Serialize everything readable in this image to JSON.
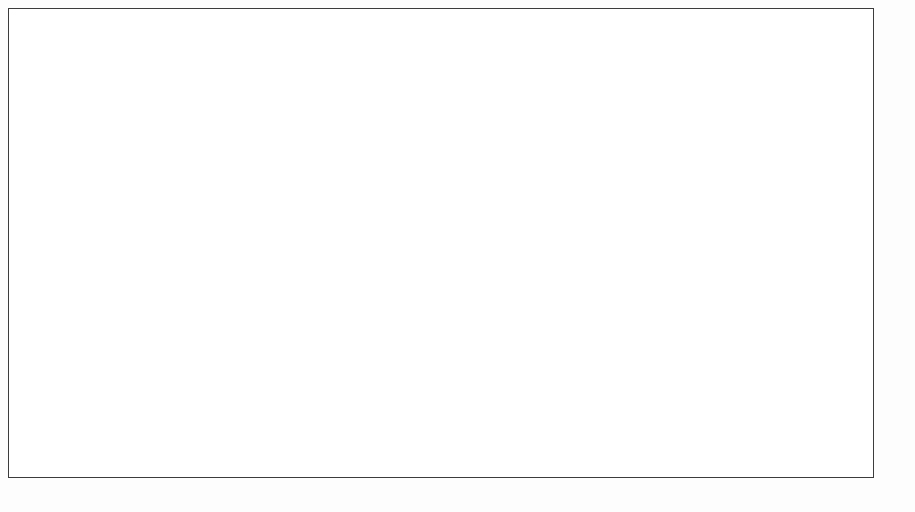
{
  "chart_data": {
    "type": "bar",
    "title": "",
    "subtitle": "",
    "xlabel": "",
    "ylabel": "",
    "orientation": "horizontal",
    "stacked": true,
    "normalized_percent": true,
    "xlim": [
      0,
      100
    ],
    "grid": false,
    "legend_position": "bottom",
    "legend_prefix": "Skala:",
    "series": [
      {
        "name": "Konservative",
        "color": "#6b6b6b"
      },
      {
        "name": "IT-affine Traditionalisten",
        "color": "#2b2b2b"
      },
      {
        "name": "Aufgeschlossene IT-Laien",
        "color": "#e9e9e9"
      },
      {
        "name": "Digitale Vorreiter",
        "color": "#c3c3c3"
      }
    ],
    "groups": [
      {
        "name": "Alter",
        "rows": [
          {
            "label": "Bis 19 Jahre",
            "values": [
              29,
              6,
              42,
              23
            ]
          },
          {
            "label": "20 - 29 Jahre",
            "values": [
              28,
              9,
              32,
              31
            ]
          },
          {
            "label": "30 - 39 Jahre",
            "values": [
              39,
              9,
              26,
              27
            ]
          },
          {
            "label": "40 - 49 Jahre",
            "values": [
              56,
              8,
              16,
              20
            ],
            "value_labels": [
              "56",
              "8",
              "16",
              ""
            ]
          },
          {
            "label": "50 - 59 Jahre",
            "values": [
              69,
              7,
              12,
              12
            ]
          },
          {
            "label": "Über 60 Jahre",
            "values": [
              77,
              7,
              8,
              8
            ]
          }
        ]
      },
      {
        "name": "Geschlecht",
        "rows": [
          {
            "label": "Männlich",
            "values": [
              42,
              11,
              17,
              30
            ]
          },
          {
            "label": "Weiblich",
            "values": [
              60,
              6,
              22,
              13
            ]
          }
        ]
      },
      {
        "name": "Bereich",
        "rows": [
          {
            "label": "Vertrieb/Markt",
            "values": [
              53,
              6,
              21,
              20
            ]
          },
          {
            "label": "Marktfolge",
            "values": [
              67,
              8,
              14,
              11
            ]
          },
          {
            "label": "Stab",
            "values": [
              46,
              12,
              15,
              27
            ]
          },
          {
            "label": "Auszubildende/Trainees",
            "values": [
              26,
              8,
              40,
              26
            ]
          }
        ]
      },
      {
        "name": "Funktion",
        "rows": [
          {
            "label": "Führungskraft",
            "values": [
              45,
              8,
              19,
              28
            ]
          },
          {
            "label": "Keine Führungskraft",
            "values": [
              54,
              8,
              20,
              19
            ]
          }
        ]
      }
    ]
  },
  "legend": {
    "scale_label": "Skala:",
    "items": [
      {
        "label": "Konservative",
        "color": "#6b6b6b"
      },
      {
        "label": "IT-affine Traditionalisten",
        "color": "#2b2b2b"
      },
      {
        "label": "Aufgeschlossene IT-Laien",
        "color": "#eeeeee"
      },
      {
        "label": "Digitale Vorreiter",
        "color": "#c3c3c3"
      }
    ]
  }
}
